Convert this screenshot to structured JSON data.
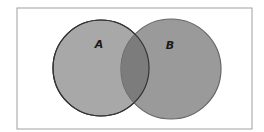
{
  "diagram": {
    "type": "venn",
    "sets": [
      {
        "id": "A",
        "label": "A",
        "cx": 101,
        "cy": 68,
        "r": 48,
        "fill": "#a8a8a8",
        "stroke": "#333333",
        "label_x": 99,
        "label_y": 48
      },
      {
        "id": "B",
        "label": "B",
        "cx": 171,
        "cy": 69,
        "r": 50,
        "fill": "#9a9a9a",
        "stroke": "#666666",
        "label_x": 170,
        "label_y": 49
      }
    ],
    "intersection": {
      "fill": "#7c7c7c",
      "label": ""
    },
    "frame": {
      "x": 17,
      "y": 8,
      "width": 235,
      "height": 121,
      "stroke": "#a0a0a0"
    }
  }
}
